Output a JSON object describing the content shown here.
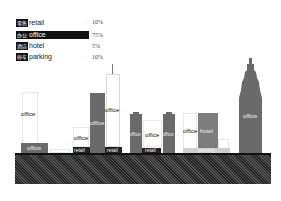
{
  "legend": {
    "items": [
      {
        "cn": "零售",
        "en": "retail",
        "pct": "10%"
      },
      {
        "cn": "办公",
        "en": "office",
        "pct": "75%"
      },
      {
        "cn": "酒店",
        "en": "hotel",
        "pct": "5%"
      },
      {
        "cn": "停车",
        "en": "parking",
        "pct": "10%"
      }
    ]
  },
  "buildings": {
    "b1": {
      "upper_label": "office",
      "base_label": "office"
    },
    "b2": {
      "upper_label": "office",
      "base_label": "retail"
    },
    "b3": {
      "label": "office"
    },
    "b4": {
      "label": "office",
      "base_label": "retail"
    },
    "b5": {
      "label": "office"
    },
    "b6": {
      "label": "office",
      "base_label": "retail"
    },
    "b7": {
      "label": "office"
    },
    "b8": {
      "ghost_label": "office",
      "label": "hotel",
      "base_label": "parking"
    },
    "b9": {
      "label": "office"
    }
  },
  "colors": {
    "dark": "#6a6a6a",
    "retail": "#222222",
    "ground": "#3a3a3a"
  }
}
